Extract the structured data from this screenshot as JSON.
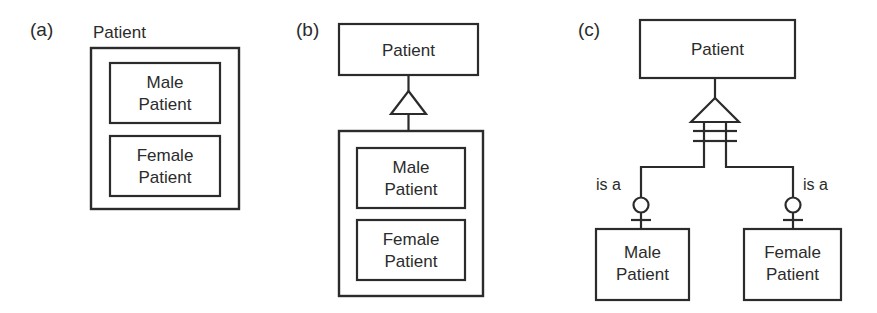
{
  "figure": {
    "background": "#ffffff",
    "line_color": "#2b2b2b",
    "text_color": "#2b2b2b",
    "width": 877,
    "height": 313
  },
  "panels": [
    {
      "id": "a",
      "label": "(a)",
      "notation": "nested-containment",
      "caption_outside": "Patient",
      "container": {
        "label": "Patient",
        "label_position": "above-outside"
      },
      "children": [
        {
          "label_line1": "Male",
          "label_line2": "Patient"
        },
        {
          "label_line1": "Female",
          "label_line2": "Patient"
        }
      ]
    },
    {
      "id": "b",
      "label": "(b)",
      "notation": "uml-generalization",
      "parent": {
        "label": "Patient"
      },
      "relationship": {
        "symbol": "hollow-triangle",
        "name": "generalization"
      },
      "container": {
        "label": ""
      },
      "children": [
        {
          "label_line1": "Male",
          "label_line2": "Patient"
        },
        {
          "label_line1": "Female",
          "label_line2": "Patient"
        }
      ]
    },
    {
      "id": "c",
      "label": "(c)",
      "notation": "er-is-a",
      "parent": {
        "label": "Patient"
      },
      "relationship": {
        "symbol": "hollow-triangle",
        "name": "generalization"
      },
      "edge_labels": [
        "is a",
        "is a"
      ],
      "cardinality_marks": {
        "parent_side": "double-bar",
        "child_side": "circle-and-bar"
      },
      "children": [
        {
          "label_line1": "Male",
          "label_line2": "Patient"
        },
        {
          "label_line1": "Female",
          "label_line2": "Patient"
        }
      ]
    }
  ]
}
